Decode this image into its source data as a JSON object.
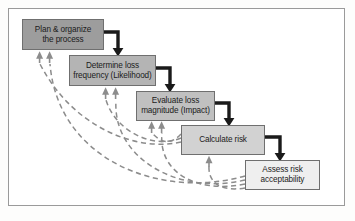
{
  "figure": {
    "background_color": "#ffffff",
    "frame_border_color": "#9a9a9a"
  },
  "palette": {
    "node_dark_fill": "#9d9d9d",
    "node_mid_fill": "#b4b4b4",
    "node_light_fill": "#c7c7c7",
    "node_lighter_fill": "#d8d8d8",
    "node_lightest_fill": "#eeeeee",
    "node_border": "#6f6f6f",
    "flow_arrow_color": "#1a1a1a",
    "feedback_arrow_color": "#8c8c8c",
    "text_color": "#1b1b1b"
  },
  "nodes": [
    {
      "id": "plan",
      "line1": "Plan & organize",
      "line2": "the process",
      "fill": "#9d9d9d",
      "x": 22,
      "y": 19,
      "w": 82,
      "h": 31
    },
    {
      "id": "frequency",
      "line1": "Determine loss",
      "line2": "frequency (Likelihood)",
      "fill": "#b4b4b4",
      "x": 69,
      "y": 55,
      "w": 87,
      "h": 31
    },
    {
      "id": "magnitude",
      "line1": "Evaluate loss",
      "line2": "magnitude (Impact)",
      "fill": "#c0c0c0",
      "x": 136,
      "y": 91,
      "w": 79,
      "h": 30
    },
    {
      "id": "calculate",
      "line1": "Calculate risk",
      "line2": "",
      "fill": "#d2d2d2",
      "x": 181,
      "y": 125,
      "w": 84,
      "h": 30
    },
    {
      "id": "assess",
      "line1": "Assess risk",
      "line2": "acceptability",
      "fill": "#efefef",
      "x": 245,
      "y": 160,
      "w": 75,
      "h": 30
    }
  ],
  "flow_arrows": [
    {
      "id": "plan-to-frequency",
      "label": "Plan & organize the process to Determine loss frequency"
    },
    {
      "id": "frequency-to-magnitude",
      "label": "Determine loss frequency to Evaluate loss magnitude"
    },
    {
      "id": "magnitude-to-calculate",
      "label": "Evaluate loss magnitude to Calculate risk"
    },
    {
      "id": "calculate-to-assess",
      "label": "Calculate risk to Assess risk acceptability"
    }
  ],
  "feedback_arrows": [
    {
      "id": "calculate-to-plan",
      "label": "Feedback from Calculate risk to Plan & organize the process"
    },
    {
      "id": "assess-to-plan",
      "label": "Feedback from Assess risk acceptability to Plan & organize the process"
    },
    {
      "id": "calculate-to-frequency",
      "label": "Feedback from Calculate risk to Determine loss frequency"
    },
    {
      "id": "assess-to-frequency",
      "label": "Feedback from Assess risk acceptability to Determine loss frequency"
    },
    {
      "id": "calculate-to-magnitude",
      "label": "Feedback from Calculate risk to Evaluate loss magnitude"
    },
    {
      "id": "assess-to-magnitude",
      "label": "Feedback from Assess risk acceptability to Evaluate loss magnitude"
    },
    {
      "id": "assess-to-calculate",
      "label": "Feedback from Assess risk acceptability to Calculate risk"
    }
  ]
}
